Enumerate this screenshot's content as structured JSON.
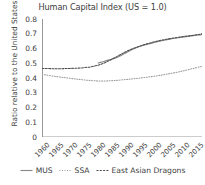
{
  "chart_data": {
    "type": "line",
    "title": "Human Capital Index (US = 1.0)",
    "xlabel": "",
    "ylabel": "Ratio relative to the United States",
    "xlim": [
      1960,
      2017
    ],
    "ylim": [
      0,
      0.8
    ],
    "yticks": [
      "0",
      "0.1",
      "0.2",
      "0.3",
      "0.4",
      "0.5",
      "0.6",
      "0.7",
      "0.8"
    ],
    "ytick_values": [
      0,
      0.1,
      0.2,
      0.3,
      0.4,
      0.5,
      0.6,
      0.7,
      0.8
    ],
    "xticks": [
      "1960",
      "1965",
      "1970",
      "1975",
      "1980",
      "1985",
      "1990",
      "1995",
      "2000",
      "2005",
      "2010",
      "2015"
    ],
    "xtick_values": [
      1960,
      1965,
      1970,
      1975,
      1980,
      1985,
      1990,
      1995,
      2000,
      2005,
      2010,
      2015
    ],
    "grid": false,
    "legend_position": "bottom",
    "series": [
      {
        "name": "MUS",
        "style": "solid",
        "color": "#8a8a8a",
        "x": [
          1980,
          1982,
          1984,
          1986,
          1988,
          1990,
          1992,
          1994,
          1996,
          1998,
          2000,
          2002,
          2004,
          2006,
          2008,
          2010,
          2012,
          2014,
          2016,
          2017
        ],
        "values": [
          0.502,
          0.512,
          0.523,
          0.535,
          0.551,
          0.572,
          0.592,
          0.609,
          0.621,
          0.631,
          0.641,
          0.65,
          0.658,
          0.665,
          0.671,
          0.677,
          0.682,
          0.687,
          0.692,
          0.695
        ]
      },
      {
        "name": "SSA",
        "style": "dotted",
        "color": "#9a9a9a",
        "x": [
          1960,
          1965,
          1970,
          1975,
          1980,
          1985,
          1990,
          1995,
          2000,
          2005,
          2010,
          2015,
          2017
        ],
        "values": [
          0.425,
          0.41,
          0.398,
          0.387,
          0.38,
          0.382,
          0.39,
          0.4,
          0.412,
          0.428,
          0.447,
          0.47,
          0.479
        ]
      },
      {
        "name": "East Asian Dragons",
        "style": "dashed",
        "color": "#4a4a4a",
        "x": [
          1960,
          1965,
          1970,
          1975,
          1980,
          1985,
          1990,
          1995,
          2000,
          2005,
          2010,
          2015,
          2017
        ],
        "values": [
          0.465,
          0.463,
          0.465,
          0.47,
          0.487,
          0.528,
          0.58,
          0.617,
          0.645,
          0.665,
          0.68,
          0.693,
          0.7
        ]
      }
    ]
  },
  "legend": {
    "items": [
      {
        "label": "MUS"
      },
      {
        "label": "SSA"
      },
      {
        "label": "East Asian Dragons"
      }
    ]
  }
}
